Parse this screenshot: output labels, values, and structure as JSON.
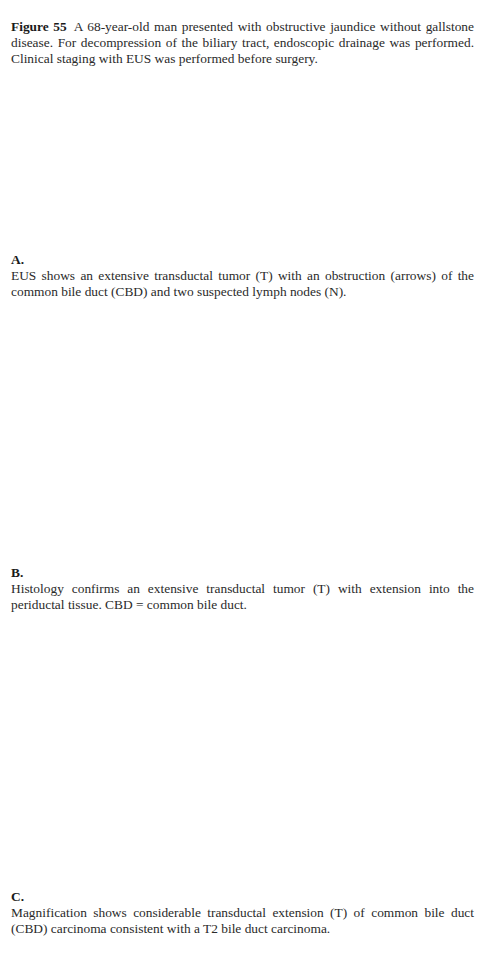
{
  "figure": {
    "label": "Figure 55",
    "caption": "A 68-year-old man presented with obstructive jaundice without gallstone disease. For decompression of the biliary tract, endoscopic drainage was performed. Clinical staging with EUS was performed before surgery."
  },
  "panels": [
    {
      "label": "A.",
      "text": "EUS shows an extensive transductal tumor (T) with an obstruction (arrows) of the common bile duct (CBD) and two suspected lymph nodes (N)."
    },
    {
      "label": "B.",
      "text": "Histology confirms an extensive transductal tumor (T) with extension into the periductal tissue. CBD = common bile duct."
    },
    {
      "label": "C.",
      "text": "Magnification shows considerable transductal extension (T) of common bile duct (CBD) carcinoma consistent with a T2 bile duct carcinoma."
    }
  ]
}
